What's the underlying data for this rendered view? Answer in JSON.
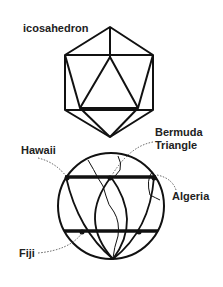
{
  "labels": {
    "icosahedron": "icosahedron",
    "bermuda_line1": "Bermuda",
    "bermuda_line2": "Triangle",
    "hawaii": "Hawaii",
    "algeria": "Algeria",
    "fiji": "Fiji"
  },
  "colors": {
    "stroke": "#111111",
    "text": "#222222"
  }
}
